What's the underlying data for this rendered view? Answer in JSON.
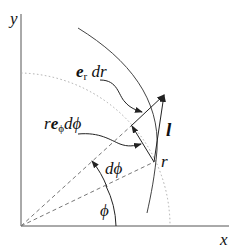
{
  "diagram": {
    "axes": {
      "x_label": "x",
      "y_label": "y"
    },
    "labels": {
      "er_bold": "e",
      "er_sub": "r",
      "er_rest": " dr",
      "rephi_r": "r",
      "rephi_bold": "e",
      "rephi_sub": "ϕ",
      "rephi_rest": "dϕ",
      "l": "l",
      "r": "r",
      "dphi": "dϕ",
      "phi": "ϕ"
    },
    "colors": {
      "line": "#444444",
      "dotted": "#aaaaaa",
      "dashed": "#777777"
    }
  }
}
